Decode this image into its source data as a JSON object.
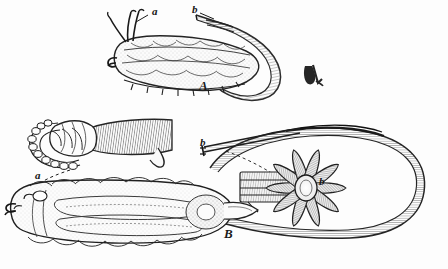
{
  "plate": {
    "kind": "antique-scientific-illustration",
    "medium": "line engraving",
    "background_color": "#fdfdfd",
    "ink_color": "#1a1a1a",
    "width": 448,
    "height": 269,
    "subject": "two anatomical figures of a parasitic larva"
  },
  "figures": [
    {
      "id": "A",
      "label": "A",
      "label_pos": {
        "x": 199,
        "y": 86
      },
      "description": "lateral view of segmented larva with long curved caudal filament",
      "parts": [
        {
          "key": "a",
          "label": "a",
          "pos": {
            "x": 152,
            "y": 12
          },
          "leader": "solid",
          "target": "anterior paired appendages / horns"
        },
        {
          "key": "b",
          "label": "b",
          "pos": {
            "x": 192,
            "y": 10
          },
          "leader": "solid",
          "target": "tip of caudal filament"
        }
      ]
    },
    {
      "id": "B",
      "label": "B",
      "label_pos": {
        "x": 224,
        "y": 234
      },
      "description": "dorsal view of larva within enveloping sac, with detail of anterior hooks and radial rosette",
      "parts": [
        {
          "key": "a",
          "label": "a",
          "pos": {
            "x": 35,
            "y": 176
          },
          "leader": "dashed",
          "target": "anterior crown of hooks (enlarged detail above)"
        },
        {
          "key": "b",
          "label": "b",
          "pos": {
            "x": 200,
            "y": 143
          },
          "leader": "solid",
          "target": "paired spine bundle"
        },
        {
          "key": "b",
          "label": "b",
          "pos": {
            "x": 319,
            "y": 182
          },
          "leader": "none",
          "target": "radial rosette of spines"
        }
      ]
    }
  ],
  "marks": [
    {
      "name": "printers-mark",
      "glyph": "ℳ",
      "pos": {
        "x": 306,
        "y": 66
      },
      "note": "small engraver's mark"
    }
  ]
}
